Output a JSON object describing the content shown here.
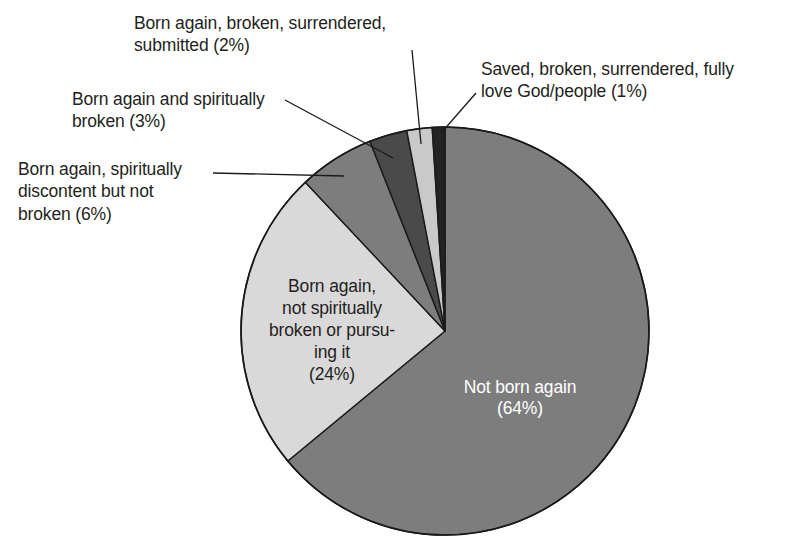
{
  "chart_data": {
    "type": "pie",
    "title": "",
    "subtitle": "",
    "legend_position": "callouts",
    "grid": false,
    "total_percent": 100,
    "start_angle_deg": 0,
    "direction": "clockwise",
    "categories": [
      "Not born again",
      "Born again, not spiritually broken or pursuing it",
      "Born again, spiritually discontent but not broken",
      "Born again and spiritually broken",
      "Born again, broken, surrendered, submitted",
      "Saved, broken, surrendered, fully love God/people"
    ],
    "values": [
      64,
      24,
      6,
      3,
      2,
      1
    ],
    "value_unit": "%",
    "colors": [
      "#7d7d7d",
      "#d9d9d9",
      "#7d7d7d",
      "#4a4a4a",
      "#c9c9c9",
      "#232323"
    ],
    "slices": [
      {
        "name": "not-born-again",
        "label": "Not born again",
        "value_label": "(64%)",
        "value": 64,
        "color": "#7d7d7d",
        "label_placement": "inside",
        "label_color": "#ffffff"
      },
      {
        "name": "born-again-not-broken",
        "label": "Born again,\nnot spiritually\nbroken or pursu-\ning it",
        "value_label": "(24%)",
        "value": 24,
        "color": "#d9d9d9",
        "label_placement": "inside",
        "label_color": "#231f20"
      },
      {
        "name": "born-again-discontent",
        "label": "Born again, spiritually\ndiscontent but not\nbroken (6%)",
        "value_label": "(6%)",
        "value": 6,
        "color": "#7d7d7d",
        "label_placement": "callout-left",
        "label_color": "#231f20"
      },
      {
        "name": "born-again-broken",
        "label": "Born again and spiritually\nbroken (3%)",
        "value_label": "(3%)",
        "value": 3,
        "color": "#4a4a4a",
        "label_placement": "callout-left",
        "label_color": "#231f20"
      },
      {
        "name": "born-again-submitted",
        "label": "Born again, broken, surrendered,\nsubmitted (2%)",
        "value_label": "(2%)",
        "value": 2,
        "color": "#c9c9c9",
        "label_placement": "callout-top",
        "label_color": "#231f20"
      },
      {
        "name": "saved-fully-love",
        "label": "Saved, broken, surrendered, fully\nlove God/people (1%)",
        "value_label": "(1%)",
        "value": 1,
        "color": "#232323",
        "label_placement": "callout-right",
        "label_color": "#231f20"
      }
    ]
  },
  "callouts": {
    "submitted": "Born again, broken, surrendered,\nsubmitted (2%)",
    "broken3": "Born again and spiritually\nbroken (3%)",
    "discontent": "Born again, spiritually\ndiscontent but not\nbroken (6%)",
    "saved": "Saved, broken, surrendered, fully\nlove God/people (1%)"
  },
  "inside_labels": {
    "not_born_again_line1": "Not born again",
    "not_born_again_line2": "(64%)",
    "born_again_line1": "Born again,",
    "born_again_line2": "not spiritually",
    "born_again_line3": "broken or pursu-",
    "born_again_line4": "ing it",
    "born_again_line5": "(24%)"
  },
  "style": {
    "background": "#ffffff",
    "outline": "#1a1a1a",
    "text_dark": "#231f20",
    "text_light": "#ffffff"
  }
}
